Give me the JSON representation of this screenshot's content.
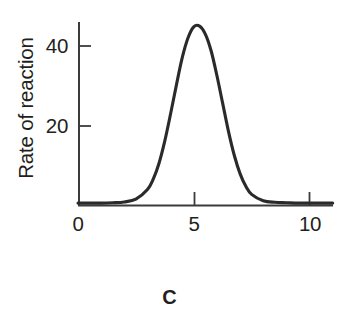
{
  "figure": {
    "panel_letter": "C"
  },
  "chart_data": {
    "type": "line",
    "title": "",
    "subtitle": "",
    "xlabel": "",
    "ylabel": "Rate of reaction",
    "xlim": [
      0,
      11.2
    ],
    "ylim": [
      0,
      52
    ],
    "grid": false,
    "legend": null,
    "annotations": [],
    "x_ticks": [
      0,
      5,
      10
    ],
    "x_tick_labels": [
      "0",
      "5",
      "10"
    ],
    "y_ticks": [
      20,
      40
    ],
    "y_tick_labels": [
      "20",
      "40"
    ],
    "tick_direction": "in",
    "axis_color": "#3b3b3b",
    "curve_color": "#2a2a2a",
    "curve_width_px": 3.1,
    "series": [
      {
        "name": "Rate of reaction",
        "shape": "gaussian",
        "peak_x": 5.05,
        "peak_y": 45,
        "baseline_y": 0.6,
        "sigma": 0.95,
        "x": [
          0.0,
          0.5,
          1.0,
          1.5,
          2.0,
          2.5,
          3.0,
          3.25,
          3.5,
          3.75,
          4.0,
          4.25,
          4.5,
          4.75,
          5.0,
          5.25,
          5.5,
          5.75,
          6.0,
          6.25,
          6.5,
          6.75,
          7.0,
          7.25,
          7.5,
          8.0,
          8.5,
          9.0,
          9.5,
          10.0,
          10.5,
          11.0
        ],
        "values": [
          0.6,
          0.6,
          0.6,
          0.7,
          0.9,
          1.6,
          4.0,
          6.6,
          10.6,
          16.2,
          23.0,
          30.2,
          37.0,
          42.0,
          44.8,
          45.0,
          43.0,
          38.8,
          32.6,
          25.6,
          18.6,
          12.6,
          8.0,
          4.8,
          2.8,
          1.2,
          0.8,
          0.7,
          0.6,
          0.6,
          0.6,
          0.6
        ]
      }
    ]
  }
}
